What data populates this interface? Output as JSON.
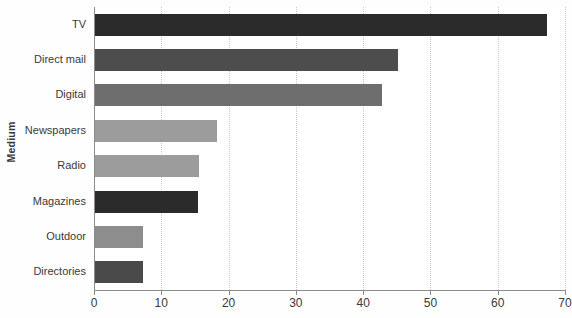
{
  "chart_data": {
    "type": "bar",
    "orientation": "horizontal",
    "title": "",
    "xlabel": "",
    "ylabel": "Medium",
    "xlim": [
      0,
      70
    ],
    "ylim": null,
    "grid": "vertical-dotted",
    "legend": "none",
    "xticks": [
      "0",
      "10",
      "20",
      "30",
      "40",
      "50",
      "60",
      "70"
    ],
    "xtick_values": [
      0,
      10,
      20,
      30,
      40,
      50,
      60,
      70
    ],
    "categories": [
      "TV",
      "Direct mail",
      "Digital",
      "Newspapers",
      "Radio",
      "Magazines",
      "Outdoor",
      "Directories"
    ],
    "values": [
      67.3,
      45.2,
      42.8,
      18.3,
      15.6,
      15.5,
      7.3,
      7.3
    ],
    "bar_colors": [
      "#2b2b2b",
      "#4d4d4d",
      "#6e6e6e",
      "#9c9c9c",
      "#9c9c9c",
      "#2b2b2b",
      "#8d8d8d",
      "#4a4a4a"
    ],
    "background_color": "#ffffff",
    "axis_color": "#8c8c8c",
    "grid_color": "#c9c9c9",
    "text_color": "#3a3a3a"
  }
}
